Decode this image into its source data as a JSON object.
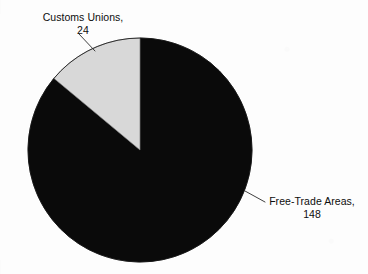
{
  "chart_data": {
    "type": "pie",
    "title": "",
    "subtitle": "",
    "xlabel": "",
    "ylabel": "",
    "legend_position": "none",
    "grid": false,
    "labels_inline": true,
    "total": 172,
    "categories": [
      "Customs Unions",
      "Free-Trade Areas"
    ],
    "values": [
      24,
      148
    ],
    "slices": [
      {
        "name": "Customs Unions",
        "value": 24,
        "percent": 13.95,
        "color": "#d8d8d8",
        "label_line1": "Customs Unions,",
        "label_line2": "24",
        "start_angle_deg": 0,
        "end_angle_deg": -50.2
      },
      {
        "name": "Free-Trade Areas",
        "value": 148,
        "percent": 86.05,
        "color": "#0a0a0a",
        "label_line1": "Free-Trade Areas,",
        "label_line2": "148",
        "start_angle_deg": 0,
        "end_angle_deg": 309.8
      }
    ],
    "geometry": {
      "center_x": 140,
      "center_y": 150,
      "radius": 112
    },
    "colors": {
      "background": "#fdfdfd",
      "slice_gray": "#d8d8d8",
      "slice_black": "#0a0a0a",
      "text": "#0d0d0d",
      "leader_line": "#2a2a2a"
    }
  },
  "labels": {
    "customs_unions": {
      "line1": "Customs Unions,",
      "line2": "24"
    },
    "free_trade_areas": {
      "line1": "Free-Trade Areas,",
      "line2": "148"
    }
  }
}
